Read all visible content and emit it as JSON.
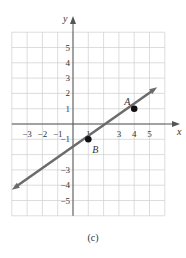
{
  "chart_data": {
    "type": "line",
    "title": "",
    "xlabel": "x",
    "ylabel": "y",
    "xlim": [
      -4,
      6
    ],
    "ylim": [
      -6,
      6
    ],
    "grid": true,
    "x_tick_labels": [
      "−3",
      "−2",
      "−1",
      "1",
      "3",
      "4",
      "5"
    ],
    "x_tick_values": [
      -3,
      -2,
      -1,
      1,
      3,
      4,
      5
    ],
    "y_tick_labels": [
      "5",
      "4",
      "3",
      "2",
      "1",
      "−1",
      "−3",
      "−4",
      "−5"
    ],
    "y_tick_values": [
      5,
      4,
      3,
      2,
      1,
      -1,
      -3,
      -4,
      -5
    ],
    "series": [
      {
        "name": "line",
        "x": [
          -4,
          5.5
        ],
        "y": [
          -4.3,
          2.4
        ],
        "color": "#6b6b6b"
      }
    ],
    "points": [
      {
        "label": "A",
        "x": 4,
        "y": 1
      },
      {
        "label": "B",
        "x": 1,
        "y": -1
      }
    ],
    "caption": "(c)"
  },
  "caption": "(c)",
  "axis": {
    "x_label": "x",
    "y_label": "y"
  },
  "points": {
    "A": "A",
    "B": "B"
  }
}
